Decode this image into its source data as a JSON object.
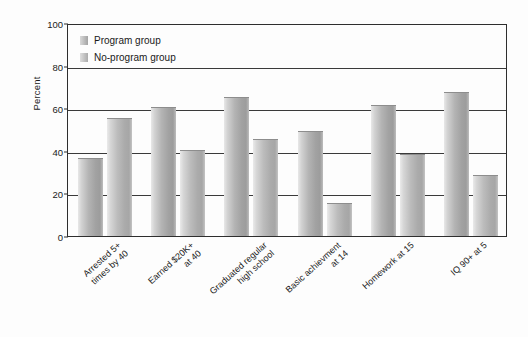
{
  "chart_data": {
    "type": "bar",
    "title": "",
    "xlabel": "",
    "ylabel": "Percent",
    "ylim": [
      0,
      100
    ],
    "yticks": [
      0,
      20,
      40,
      60,
      80,
      100
    ],
    "grid": true,
    "legend_position": "top-left",
    "categories": [
      "Arrested 5+\ntimes by 40",
      "Earned $20K+\nat 40",
      "Graduated regular\nhigh school",
      "Basic achievment\nat 14",
      "Homework at 15",
      "IQ 90+ at 5"
    ],
    "series": [
      {
        "name": "Program group",
        "values": [
          36,
          60,
          65,
          49,
          61,
          67
        ]
      },
      {
        "name": "No-program group",
        "values": [
          55,
          40,
          45,
          15,
          38,
          28
        ]
      }
    ]
  },
  "legend": {
    "items": [
      {
        "label": "Program group"
      },
      {
        "label": "No-program group"
      }
    ]
  },
  "axis": {
    "y_title": "Percent",
    "y_tick_labels": [
      "100",
      "80",
      "60",
      "40",
      "20",
      "0"
    ]
  }
}
